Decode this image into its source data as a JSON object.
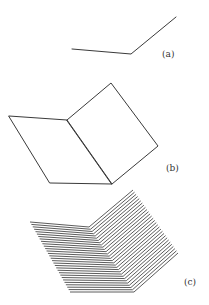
{
  "figure": {
    "panels": [
      {
        "id": "a",
        "label": "(a)",
        "description": "bent line (fold edge only)"
      },
      {
        "id": "b",
        "label": "(b)",
        "description": "two quadrilateral faces joined at fold"
      },
      {
        "id": "c",
        "label": "(c)",
        "description": "two faces filled with parallel hatch lines"
      }
    ],
    "colors": {
      "line": "#3a3a3a",
      "background": "#ffffff"
    }
  }
}
